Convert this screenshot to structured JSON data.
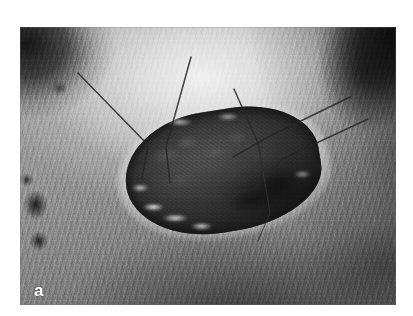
{
  "figure": {
    "panel_label": "a",
    "caption": "",
    "modality": "grayscale-photograph",
    "colors": {
      "page_background": "#ffffff",
      "photo_midtone": "#a8a8a8",
      "photo_highlight": "#e8e8e8",
      "photo_shadow": "#1b1b1b",
      "wound_bed": "#3a3a3a",
      "wound_rim_highlight": "#fcfcfc",
      "suture_thread": "#2a2a2a",
      "label_color": "#ffffff"
    },
    "photo_frame": {
      "left_px": 20,
      "top_px": 27,
      "width_px": 376,
      "height_px": 278
    },
    "regions": [
      {
        "name": "background-dark-upper-left",
        "description": "dark out-of-focus background wedge"
      },
      {
        "name": "background-dark-upper-right",
        "description": "dark out-of-focus background wedge"
      },
      {
        "name": "skin-dome-highlight",
        "description": "bright shaved skin over the body dome"
      },
      {
        "name": "fur-striations",
        "description": "fine directional hair texture over flank"
      },
      {
        "name": "wound-defect",
        "description": "central dark granulating tissue defect"
      },
      {
        "name": "wound-rim-crust",
        "description": "bright crusted epithelial rim around defect"
      },
      {
        "name": "suture-threads",
        "description": "dark monofilament suture strands radiating from the wound"
      },
      {
        "name": "dark-skin-spots-left",
        "description": "small pigmented spots along left flank"
      }
    ],
    "sutures": [
      {
        "id": "suture-1",
        "path": "M 58 46 L 128 118 L 122 152"
      },
      {
        "id": "suture-2",
        "path": "M 171 30 L 146 120 L 150 156"
      },
      {
        "id": "suture-3",
        "path": "M 214 62 L 238 116 L 244 150"
      },
      {
        "id": "suture-4",
        "path": "M 330 70 L 248 110 L 213 130"
      },
      {
        "id": "suture-5",
        "path": "M 348 92 L 262 132 L 236 160"
      },
      {
        "id": "suture-6",
        "path": "M 240 126 L 250 186 L 238 214"
      }
    ]
  }
}
